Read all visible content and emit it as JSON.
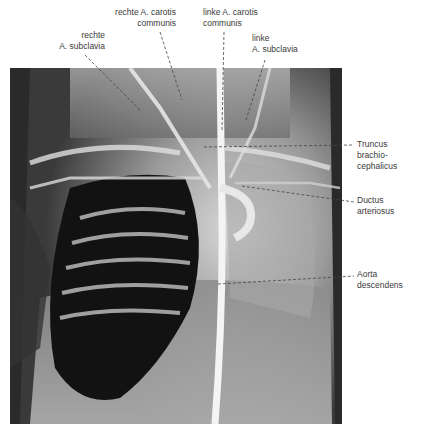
{
  "figure": {
    "type": "annotated chest angiogram (radiograph)",
    "labels": [
      {
        "id": "rechte-a-subclavia",
        "text": "rechte\nA. subclavia"
      },
      {
        "id": "rechte-a-carotis-communis",
        "text": "rechte A. carotis\ncommunis"
      },
      {
        "id": "linke-a-carotis-communis",
        "text": "linke A. carotis\ncommunis"
      },
      {
        "id": "linke-a-subclavia",
        "text": "linke\nA. subclavia"
      },
      {
        "id": "truncus-brachiocephalicus",
        "text": "Truncus\nbrachio-\ncephalicus"
      },
      {
        "id": "ductus-arteriosus",
        "text": "Ductus\narteriosus"
      },
      {
        "id": "aorta-descendens",
        "text": "Aorta\ndescendens"
      }
    ],
    "colors": {
      "background": "#ffffff",
      "label_text": "#3a3a3a",
      "leader_line": "#444444",
      "xray_dark": "#141414",
      "xray_light": "#e8e8e8"
    }
  }
}
